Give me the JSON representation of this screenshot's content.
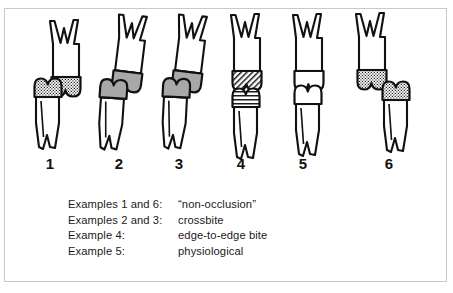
{
  "figure": {
    "background_color": "#ffffff",
    "frame_color": "#c9c9c9",
    "outline_color": "#111111",
    "gray_fill_color": "#a8a8a8",
    "white_fill_color": "#ffffff",
    "stipple_name": "dotted-stipple-pattern",
    "hatch_name": "diagonal-hatch-pattern"
  },
  "specimens": [
    {
      "number": "1",
      "condition": "non-occlusion",
      "upper_crown_fill": "stipple",
      "lower_crown_fill": "stipple",
      "alignment": "lower tooth offset to the left, no contact"
    },
    {
      "number": "2",
      "condition": "crossbite",
      "upper_crown_fill": "gray",
      "lower_crown_fill": "gray",
      "alignment": "lower tooth offset left, cusp-to-cusp slide"
    },
    {
      "number": "3",
      "condition": "crossbite",
      "upper_crown_fill": "gray",
      "lower_crown_fill": "gray",
      "alignment": "lower tooth offset left, cusp-to-cusp slide"
    },
    {
      "number": "4",
      "condition": "edge-to-edge bite",
      "upper_crown_fill": "hatch",
      "lower_crown_fill": "hatch",
      "alignment": "cusps meet tip to tip, vertically aligned"
    },
    {
      "number": "5",
      "condition": "physiological",
      "upper_crown_fill": "white",
      "lower_crown_fill": "white",
      "alignment": "proper interdigitation, vertically aligned"
    },
    {
      "number": "6",
      "condition": "non-occlusion",
      "upper_crown_fill": "stipple",
      "lower_crown_fill": "stipple",
      "alignment": "lower tooth offset to the right, no contact"
    }
  ],
  "numbers": [
    "1",
    "2",
    "3",
    "4",
    "5",
    "6"
  ],
  "caption": {
    "rows": [
      {
        "label": "Examples 1 and 6:",
        "value": "“non-occlusion”"
      },
      {
        "label": "Examples 2 and 3:",
        "value": "crossbite"
      },
      {
        "label": "Example 4:",
        "value": "edge-to-edge bite"
      },
      {
        "label": "Example 5:",
        "value": "physiological"
      }
    ]
  }
}
